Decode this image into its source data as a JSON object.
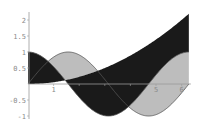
{
  "chart_data": {
    "type": "area",
    "title": "",
    "xlabel": "",
    "ylabel": "",
    "xlim": [
      0,
      6.2832
    ],
    "ylim": [
      -1,
      2.15
    ],
    "grid": false,
    "legend": null,
    "x_ticks": [
      1,
      2,
      3,
      4,
      5,
      6
    ],
    "x_tick_labels_visible": [
      "1",
      "5",
      "6"
    ],
    "y_ticks": [
      -1,
      -0.5,
      0.5,
      1,
      1.5,
      2
    ],
    "y_tick_labels": [
      "-1",
      "-0.5",
      "0.5",
      "1",
      "1.5",
      "2"
    ],
    "curves": [
      {
        "name": "cos(x)",
        "function": "cos"
      },
      {
        "name": "sin(x)",
        "function": "sin"
      },
      {
        "name": "x^2/18",
        "function": "quadratic",
        "coefficient": 0.0556
      }
    ],
    "series": [
      {
        "name": "fill between sin(x) and cos(x)",
        "color": "#bdbdbd",
        "upper": "sin(x)",
        "lower": "cos(x)",
        "x": [
          0,
          0.785,
          1.571,
          2.356,
          3.142,
          3.927,
          4.712,
          5.498,
          6.283
        ],
        "values_a": [
          0,
          0.707,
          1,
          0.707,
          0,
          -0.707,
          -1,
          -0.707,
          0
        ],
        "values_b": [
          1,
          0.707,
          0,
          -0.707,
          -1,
          -0.707,
          0,
          0.707,
          1
        ]
      },
      {
        "name": "fill between cos(x) and x^2/18",
        "color": "#1a1a1a",
        "upper": "x^2/18",
        "lower": "cos(x)",
        "x": [
          0,
          0.785,
          1.571,
          2.356,
          3.142,
          3.927,
          4.712,
          5.498,
          6.283
        ],
        "values_a": [
          1,
          0.707,
          0,
          -0.707,
          -1,
          -0.707,
          0,
          0.707,
          1
        ],
        "values_b": [
          0,
          0.034,
          0.137,
          0.308,
          0.548,
          0.857,
          1.234,
          1.679,
          2.193
        ]
      }
    ]
  },
  "axes": {
    "x_labels": [
      {
        "v": 1,
        "t": "1"
      },
      {
        "v": 5,
        "t": "5"
      },
      {
        "v": 6,
        "t": "6"
      }
    ],
    "y_labels": [
      {
        "v": 2,
        "t": "2"
      },
      {
        "v": 1.5,
        "t": "1.5"
      },
      {
        "v": 1,
        "t": "1"
      },
      {
        "v": 0.5,
        "t": "0.5"
      },
      {
        "v": -0.5,
        "t": "-0.5"
      },
      {
        "v": -1,
        "t": "-1"
      }
    ]
  },
  "colors": {
    "light_fill": "#bdbdbd",
    "dark_fill": "#1a1a1a",
    "curve_stroke": "#555555",
    "axis": "#9a9a9a"
  }
}
